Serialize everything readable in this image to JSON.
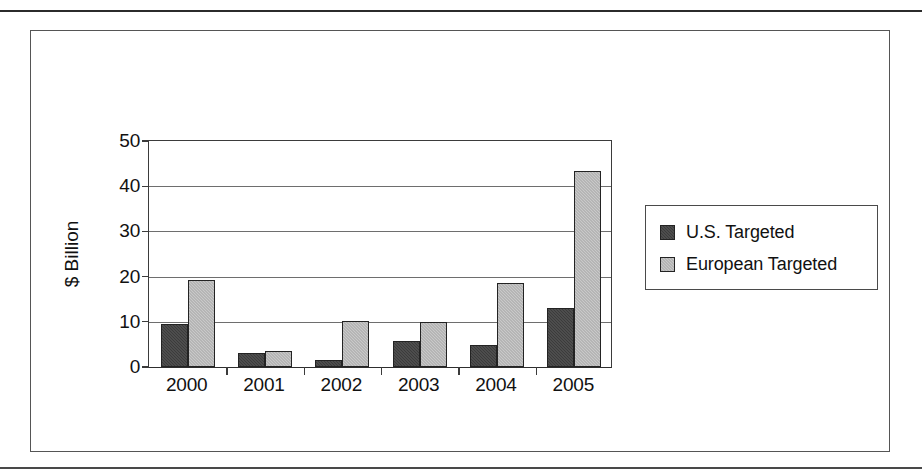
{
  "chart_data": {
    "type": "bar",
    "title": "",
    "subtitle": "",
    "xlabel": "",
    "ylabel": "$ Billion",
    "categories": [
      "2000",
      "2001",
      "2002",
      "2003",
      "2004",
      "2005"
    ],
    "series": [
      {
        "name": "U.S. Targeted",
        "color": "#3b3b3b",
        "values": [
          9.5,
          3.0,
          1.5,
          5.8,
          4.8,
          13.0
        ]
      },
      {
        "name": "European Targeted",
        "color": "#c9c9c9",
        "values": [
          19.0,
          3.5,
          10.2,
          9.8,
          18.5,
          43.0
        ]
      }
    ],
    "ylim": [
      0,
      50
    ],
    "yticks": [
      0,
      10,
      20,
      30,
      40,
      50
    ],
    "ytick_labels": [
      "0",
      "10",
      "20",
      "30",
      "40",
      "50"
    ],
    "grid": true,
    "grid_axis": "y",
    "legend_position": "right",
    "legend_entries": [
      "U.S. Targeted",
      "European Targeted"
    ]
  },
  "figure": {
    "frame_border_color": "#555555",
    "rule_color": "#2b2b2b",
    "background": "#ffffff"
  }
}
